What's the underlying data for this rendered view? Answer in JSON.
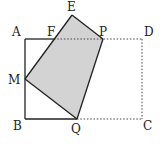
{
  "diagram": {
    "type": "geometry-figure",
    "colors": {
      "stroke": "#222222",
      "dotted": "#444444",
      "fill": "#d3d3d3",
      "background": "#ffffff"
    },
    "points": {
      "A": {
        "label": "A",
        "x": 25,
        "y": 39
      },
      "B": {
        "label": "B",
        "x": 25,
        "y": 119
      },
      "C": {
        "label": "C",
        "x": 142,
        "y": 119
      },
      "D": {
        "label": "D",
        "x": 142,
        "y": 39
      },
      "E": {
        "label": "E",
        "x": 72,
        "y": 15
      },
      "F": {
        "label": "F",
        "x": 54,
        "y": 39
      },
      "P": {
        "label": "P",
        "x": 103,
        "y": 39
      },
      "M": {
        "label": "M",
        "x": 25,
        "y": 79
      },
      "Q": {
        "label": "Q",
        "x": 77,
        "y": 119
      }
    },
    "solid_segments": [
      "A-F",
      "A-B",
      "B-Q",
      "M-E",
      "E-P",
      "P-Q",
      "Q-M"
    ],
    "dotted_segments": [
      "F-D",
      "D-C",
      "C-Q"
    ],
    "shaded_polygon": [
      "M",
      "E",
      "P",
      "Q"
    ]
  }
}
